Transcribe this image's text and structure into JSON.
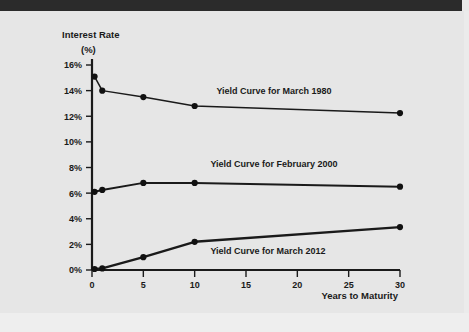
{
  "chart_data": {
    "type": "line",
    "title": "",
    "subtitle": "",
    "xlabel": "Years to Maturity",
    "ylabel": "Interest Rate (%)",
    "ylabel_line1": "Interest Rate",
    "ylabel_line2": "(%)",
    "grid": false,
    "legend_position": "inline-annotations",
    "xticks": [
      "0",
      "5",
      "10",
      "15",
      "20",
      "25",
      "30"
    ],
    "xtick_values": [
      0,
      5,
      10,
      15,
      20,
      25,
      30
    ],
    "yticks": [
      "0%",
      "2%",
      "4%",
      "6%",
      "8%",
      "10%",
      "12%",
      "14%",
      "16%"
    ],
    "ytick_values": [
      0,
      2,
      4,
      6,
      8,
      10,
      12,
      14,
      16
    ],
    "xlim": [
      0,
      30
    ],
    "ylim": [
      0,
      16
    ],
    "x": [
      0.25,
      1,
      5,
      10,
      30
    ],
    "series": [
      {
        "name": "Yield Curve for March 1980",
        "annotation": "Yield Curve for March 1980",
        "color": "#1a1a1a",
        "values": [
          15.1,
          14.0,
          13.5,
          12.8,
          12.25
        ]
      },
      {
        "name": "Yield Curve for February 2000",
        "annotation": "Yield Curve for February 2000",
        "color": "#1a1a1a",
        "values": [
          6.1,
          6.25,
          6.8,
          6.8,
          6.5
        ]
      },
      {
        "name": "Yield Curve for March 2012",
        "annotation": "Yield Curve for March 2012",
        "color": "#1a1a1a",
        "values": [
          0.08,
          0.12,
          1.0,
          2.2,
          3.35
        ]
      }
    ],
    "annotations": [
      {
        "text": "Yield Curve for March 1980",
        "x_px": 274,
        "y_px": 83
      },
      {
        "text": "Yield Curve for February 2000",
        "x_px": 274,
        "y_px": 156
      },
      {
        "text": "Yield Curve for March 2012",
        "x_px": 268,
        "y_px": 243
      }
    ]
  },
  "figure": {
    "background_color": "#e6e6e6",
    "top_bar_color": "#2b2b2b",
    "axis_color": "#1a1a1a",
    "line_color": "#1a1a1a",
    "marker_color": "#111111"
  }
}
